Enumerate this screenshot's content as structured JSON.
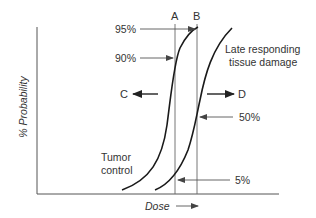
{
  "diagram": {
    "y_axis_label": "% Probability",
    "x_axis_label": "Dose",
    "curves": [
      {
        "name": "Tumor control",
        "label_line1": "Tumor",
        "label_line2": "control"
      },
      {
        "name": "Late responding tissue damage",
        "label_line1": "Late responding",
        "label_line2": "tissue damage"
      }
    ],
    "markers": {
      "A": "A",
      "B": "B",
      "C": "C",
      "D": "D"
    },
    "percent_labels": {
      "p95": "95%",
      "p90": "90%",
      "p50": "50%",
      "p5": "5%"
    },
    "colors": {
      "curve": "#1a1a1a",
      "axis": "#555555",
      "guide": "#555555",
      "text": "#333333"
    }
  }
}
